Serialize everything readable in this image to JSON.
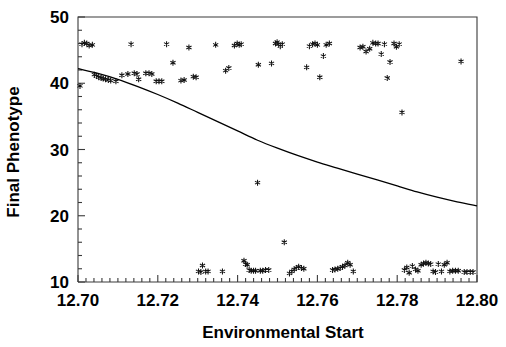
{
  "chart_data": {
    "type": "scatter",
    "title": "",
    "xlabel": "Environmental Start",
    "ylabel": "Final Phenotype",
    "xlim": [
      12.7,
      12.8
    ],
    "ylim": [
      10,
      50
    ],
    "xticks": [
      12.7,
      12.72,
      12.74,
      12.76,
      12.78,
      12.8
    ],
    "xtick_labels": [
      "12.70",
      "12.72",
      "12.74",
      "12.76",
      "12.78",
      "12.80"
    ],
    "yticks": [
      10,
      20,
      30,
      40,
      50
    ],
    "ytick_labels": [
      "10",
      "20",
      "30",
      "40",
      "50"
    ],
    "x_minor_tick_step": 0.002,
    "y_minor_tick_step": 2,
    "grid": false,
    "legend": null,
    "marker": "asterisk",
    "marker_color": "#111111",
    "frame_color": "#3a3a3a",
    "series": [
      {
        "name": "observations",
        "marker": "asterisk",
        "points": [
          [
            12.7005,
            39.6
          ],
          [
            12.701,
            45.9
          ],
          [
            12.7016,
            46.1
          ],
          [
            12.7022,
            46.0
          ],
          [
            12.7028,
            45.7
          ],
          [
            12.7036,
            45.8
          ],
          [
            12.7041,
            41.3
          ],
          [
            12.7046,
            41.1
          ],
          [
            12.7052,
            40.9
          ],
          [
            12.7058,
            40.8
          ],
          [
            12.7063,
            40.7
          ],
          [
            12.7069,
            40.6
          ],
          [
            12.7076,
            40.5
          ],
          [
            12.7082,
            40.4
          ],
          [
            12.7095,
            40.3
          ],
          [
            12.711,
            41.2
          ],
          [
            12.7125,
            41.4
          ],
          [
            12.7133,
            45.9
          ],
          [
            12.7141,
            41.5
          ],
          [
            12.7148,
            41.4
          ],
          [
            12.7152,
            40.6
          ],
          [
            12.717,
            41.5
          ],
          [
            12.7178,
            41.5
          ],
          [
            12.7185,
            41.4
          ],
          [
            12.7196,
            40.3
          ],
          [
            12.7203,
            40.3
          ],
          [
            12.721,
            40.3
          ],
          [
            12.7222,
            45.9
          ],
          [
            12.7238,
            43.1
          ],
          [
            12.7258,
            40.4
          ],
          [
            12.7266,
            40.5
          ],
          [
            12.7278,
            45.4
          ],
          [
            12.7289,
            41.0
          ],
          [
            12.7296,
            40.9
          ],
          [
            12.7302,
            11.6
          ],
          [
            12.7308,
            11.5
          ],
          [
            12.7312,
            12.5
          ],
          [
            12.732,
            11.6
          ],
          [
            12.7326,
            11.6
          ],
          [
            12.7345,
            45.8
          ],
          [
            12.7362,
            11.6
          ],
          [
            12.737,
            41.9
          ],
          [
            12.7378,
            42.3
          ],
          [
            12.7392,
            45.7
          ],
          [
            12.7399,
            46.0
          ],
          [
            12.7404,
            45.8
          ],
          [
            12.7409,
            45.9
          ],
          [
            12.7416,
            13.2
          ],
          [
            12.742,
            12.7
          ],
          [
            12.7424,
            12.6
          ],
          [
            12.7429,
            11.8
          ],
          [
            12.7434,
            11.7
          ],
          [
            12.744,
            11.7
          ],
          [
            12.7445,
            11.7
          ],
          [
            12.745,
            25.0
          ],
          [
            12.7452,
            42.8
          ],
          [
            12.7457,
            11.7
          ],
          [
            12.7463,
            11.7
          ],
          [
            12.747,
            11.8
          ],
          [
            12.7478,
            11.8
          ],
          [
            12.7485,
            43.0
          ],
          [
            12.7495,
            46.0
          ],
          [
            12.7499,
            46.2
          ],
          [
            12.7503,
            45.9
          ],
          [
            12.7507,
            45.6
          ],
          [
            12.7512,
            45.9
          ],
          [
            12.7517,
            16.0
          ],
          [
            12.753,
            11.3
          ],
          [
            12.7536,
            11.6
          ],
          [
            12.7542,
            11.9
          ],
          [
            12.7547,
            12.1
          ],
          [
            12.7553,
            12.3
          ],
          [
            12.756,
            12.1
          ],
          [
            12.7566,
            12.0
          ],
          [
            12.7573,
            42.4
          ],
          [
            12.758,
            45.6
          ],
          [
            12.7588,
            45.9
          ],
          [
            12.7594,
            46.0
          ],
          [
            12.76,
            45.8
          ],
          [
            12.7606,
            40.9
          ],
          [
            12.7615,
            44.1
          ],
          [
            12.7622,
            45.8
          ],
          [
            12.763,
            46.0
          ],
          [
            12.7638,
            11.8
          ],
          [
            12.7644,
            11.9
          ],
          [
            12.7651,
            12.0
          ],
          [
            12.7657,
            12.1
          ],
          [
            12.7663,
            12.3
          ],
          [
            12.7669,
            12.5
          ],
          [
            12.7676,
            12.9
          ],
          [
            12.7682,
            12.6
          ],
          [
            12.769,
            11.6
          ],
          [
            12.7707,
            45.4
          ],
          [
            12.7714,
            45.5
          ],
          [
            12.7722,
            44.8
          ],
          [
            12.7731,
            45.2
          ],
          [
            12.7739,
            46.1
          ],
          [
            12.7746,
            46.0
          ],
          [
            12.7752,
            46.0
          ],
          [
            12.776,
            44.4
          ],
          [
            12.7768,
            45.9
          ],
          [
            12.7775,
            40.8
          ],
          [
            12.7782,
            43.2
          ],
          [
            12.7792,
            46.0
          ],
          [
            12.7798,
            45.5
          ],
          [
            12.7805,
            45.9
          ],
          [
            12.7812,
            35.6
          ],
          [
            12.7818,
            11.8
          ],
          [
            12.7824,
            12.2
          ],
          [
            12.783,
            11.4
          ],
          [
            12.7838,
            12.4
          ],
          [
            12.7846,
            11.9
          ],
          [
            12.7852,
            11.7
          ],
          [
            12.786,
            12.6
          ],
          [
            12.7866,
            12.8
          ],
          [
            12.7872,
            12.9
          ],
          [
            12.7878,
            12.8
          ],
          [
            12.7884,
            12.7
          ],
          [
            12.789,
            11.6
          ],
          [
            12.7896,
            11.5
          ],
          [
            12.7903,
            12.7
          ],
          [
            12.7911,
            11.6
          ],
          [
            12.7918,
            12.6
          ],
          [
            12.7925,
            12.9
          ],
          [
            12.7932,
            11.6
          ],
          [
            12.7939,
            11.7
          ],
          [
            12.7946,
            11.7
          ],
          [
            12.7953,
            11.7
          ],
          [
            12.796,
            43.3
          ],
          [
            12.7968,
            11.5
          ],
          [
            12.7975,
            11.5
          ],
          [
            12.7983,
            11.5
          ],
          [
            12.799,
            11.5
          ]
        ]
      }
    ],
    "fit_curve": {
      "name": "fitted-trend",
      "style": "solid",
      "points": [
        [
          12.7,
          42.2
        ],
        [
          12.705,
          41.5
        ],
        [
          12.71,
          40.6
        ],
        [
          12.715,
          39.5
        ],
        [
          12.72,
          38.3
        ],
        [
          12.725,
          37.0
        ],
        [
          12.73,
          35.6
        ],
        [
          12.735,
          34.2
        ],
        [
          12.74,
          32.8
        ],
        [
          12.745,
          31.4
        ],
        [
          12.75,
          30.2
        ],
        [
          12.755,
          29.1
        ],
        [
          12.76,
          28.1
        ],
        [
          12.765,
          27.2
        ],
        [
          12.77,
          26.3
        ],
        [
          12.775,
          25.4
        ],
        [
          12.78,
          24.5
        ],
        [
          12.785,
          23.6
        ],
        [
          12.79,
          22.8
        ],
        [
          12.795,
          22.1
        ],
        [
          12.8,
          21.5
        ]
      ]
    }
  }
}
